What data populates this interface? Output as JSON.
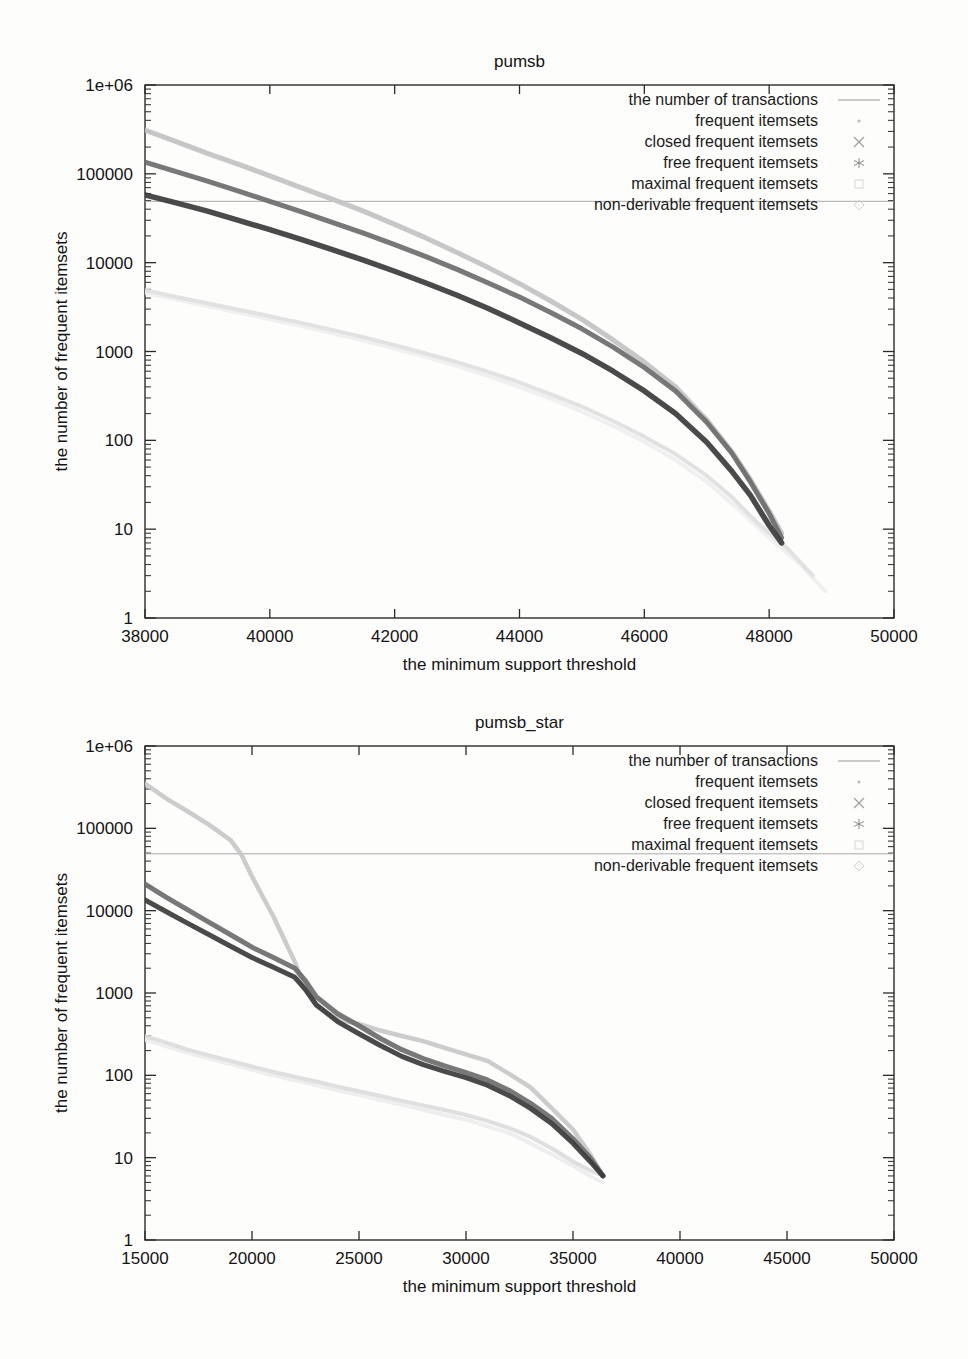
{
  "figure": {
    "background_color": "#fdfdfc",
    "axis_color": "#2b2b2b"
  },
  "shared": {
    "xlabel": "the minimum support threshold",
    "ylabel": "the number of frequent itemsets",
    "y_tick_labels": [
      "1",
      "10",
      "100",
      "1000",
      "10000",
      "100000",
      "1e+06"
    ],
    "ylim": [
      1,
      1000000
    ],
    "legend_entries": [
      {
        "label": "the number of transactions",
        "marker": "line",
        "color": "#9a9a9a"
      },
      {
        "label": "frequent itemsets",
        "marker": "dot",
        "color": "#bdbdbd"
      },
      {
        "label": "closed frequent itemsets",
        "marker": "cross",
        "color": "#9c9c9c"
      },
      {
        "label": "free frequent itemsets",
        "marker": "star",
        "color": "#8a8a8a"
      },
      {
        "label": "maximal frequent itemsets",
        "marker": "square",
        "color": "#d6d6d6"
      },
      {
        "label": "non-derivable frequent itemsets",
        "marker": "diamond",
        "color": "#cfcfcf"
      }
    ]
  },
  "chart_data": [
    {
      "id": "pumsb",
      "type": "line",
      "title": "pumsb",
      "xlabel": "the minimum support threshold",
      "ylabel": "the number of frequent itemsets",
      "xlim": [
        38000,
        50000
      ],
      "ylim": [
        1,
        1000000
      ],
      "yscale": "log",
      "x_tick_labels": [
        "38000",
        "40000",
        "42000",
        "44000",
        "46000",
        "48000",
        "50000"
      ],
      "x_ticks": [
        38000,
        40000,
        42000,
        44000,
        46000,
        48000,
        50000
      ],
      "y_tick_labels": [
        "1",
        "10",
        "100",
        "1000",
        "10000",
        "100000",
        "1e+06"
      ],
      "grid": false,
      "legend_position": "top-right",
      "series": [
        {
          "name": "the number of transactions",
          "color": "#a3a3a3",
          "width": 1.0,
          "x": [
            38000,
            50000
          ],
          "values": [
            49046,
            49046
          ]
        },
        {
          "name": "frequent itemsets",
          "color": "#c2c2c2",
          "width": 5.0,
          "x": [
            38000,
            38500,
            39000,
            39500,
            40000,
            40500,
            41000,
            41500,
            42000,
            42500,
            43000,
            43500,
            44000,
            44500,
            45000,
            45500,
            46000,
            46500,
            47000,
            47400,
            47700,
            48000,
            48200
          ],
          "values": [
            310000,
            230000,
            170000,
            128000,
            95000,
            70000,
            52000,
            38000,
            27000,
            19000,
            13000,
            8800,
            5800,
            3700,
            2300,
            1350,
            760,
            400,
            170,
            75,
            36,
            16,
            9
          ]
        },
        {
          "name": "closed frequent itemsets",
          "color": "#6d6d6d",
          "width": 5.0,
          "x": [
            38000,
            38500,
            39000,
            39500,
            40000,
            40500,
            41000,
            41500,
            42000,
            42500,
            43000,
            43500,
            44000,
            44500,
            45000,
            45500,
            46000,
            46500,
            47000,
            47400,
            47700,
            48000,
            48200
          ],
          "values": [
            135000,
            106000,
            83000,
            64000,
            49000,
            37500,
            28500,
            21500,
            16000,
            11700,
            8400,
            5900,
            4100,
            2750,
            1800,
            1120,
            660,
            360,
            160,
            72,
            34,
            15,
            8
          ]
        },
        {
          "name": "free frequent itemsets",
          "color": "#3b3b3b",
          "width": 5.5,
          "x": [
            38000,
            38500,
            39000,
            39500,
            40000,
            40500,
            41000,
            41500,
            42000,
            42500,
            43000,
            43500,
            44000,
            44500,
            45000,
            45500,
            46000,
            46500,
            47000,
            47400,
            47700,
            48000,
            48200
          ],
          "values": [
            58000,
            47000,
            38000,
            30000,
            23500,
            18300,
            14000,
            10700,
            8000,
            5900,
            4300,
            3050,
            2100,
            1430,
            950,
            600,
            360,
            200,
            95,
            45,
            24,
            11,
            7
          ]
        },
        {
          "name": "maximal frequent itemsets",
          "color": "#e0e0e0",
          "width": 4.0,
          "x": [
            38000,
            38500,
            39000,
            39500,
            40000,
            40500,
            41000,
            41500,
            42000,
            42500,
            43000,
            43500,
            44000,
            44500,
            45000,
            45500,
            46000,
            46500,
            47000,
            47400,
            47800,
            48300,
            48700
          ],
          "values": [
            4900,
            4100,
            3500,
            2950,
            2500,
            2100,
            1750,
            1450,
            1180,
            950,
            760,
            590,
            450,
            330,
            240,
            165,
            110,
            70,
            40,
            23,
            12,
            6,
            3
          ]
        },
        {
          "name": "non-derivable frequent itemsets",
          "color": "#efefef",
          "width": 4.0,
          "x": [
            38000,
            38500,
            39000,
            39500,
            40000,
            40500,
            41000,
            41500,
            42000,
            42500,
            43000,
            43500,
            44000,
            44500,
            45000,
            45500,
            46000,
            46500,
            47000,
            47500,
            48000,
            48500,
            48900
          ],
          "values": [
            4600,
            3850,
            3250,
            2750,
            2300,
            1930,
            1600,
            1330,
            1080,
            870,
            690,
            530,
            400,
            295,
            210,
            145,
            96,
            60,
            34,
            17,
            8,
            4,
            2
          ]
        }
      ]
    },
    {
      "id": "pumsb_star",
      "type": "line",
      "title": "pumsb_star",
      "xlabel": "the minimum support threshold",
      "ylabel": "the number of frequent itemsets",
      "xlim": [
        15000,
        50000
      ],
      "ylim": [
        1,
        1000000
      ],
      "yscale": "log",
      "x_tick_labels": [
        "15000",
        "20000",
        "25000",
        "30000",
        "35000",
        "40000",
        "45000",
        "50000"
      ],
      "x_ticks": [
        15000,
        20000,
        25000,
        30000,
        35000,
        40000,
        45000,
        50000
      ],
      "y_tick_labels": [
        "1",
        "10",
        "100",
        "1000",
        "10000",
        "100000",
        "1e+06"
      ],
      "grid": false,
      "legend_position": "top-right",
      "series": [
        {
          "name": "the number of transactions",
          "color": "#a3a3a3",
          "width": 1.0,
          "x": [
            15000,
            50000
          ],
          "values": [
            49046,
            49046
          ]
        },
        {
          "name": "frequent itemsets",
          "color": "#c8c8c8",
          "width": 4.5,
          "x": [
            15000,
            16000,
            17000,
            18000,
            19000,
            19500,
            20000,
            21000,
            22000,
            22500,
            23000,
            24000,
            25000,
            26000,
            27000,
            28000,
            29000,
            30000,
            31000,
            32000,
            33000,
            34000,
            35000,
            35800,
            36400
          ],
          "values": [
            350000,
            230000,
            160000,
            110000,
            72000,
            48000,
            26000,
            8500,
            2400,
            1100,
            700,
            480,
            420,
            350,
            300,
            260,
            215,
            180,
            150,
            105,
            72,
            40,
            22,
            11,
            6
          ]
        },
        {
          "name": "closed frequent itemsets",
          "color": "#6d6d6d",
          "width": 5.0,
          "x": [
            15000,
            16000,
            17000,
            18000,
            19000,
            20000,
            21000,
            22000,
            22500,
            23000,
            24000,
            25000,
            26000,
            27000,
            28000,
            29000,
            30000,
            31000,
            32000,
            33000,
            34000,
            35000,
            35800,
            36400
          ],
          "values": [
            21000,
            14500,
            10200,
            7200,
            5100,
            3600,
            2700,
            2000,
            1400,
            900,
            560,
            400,
            280,
            205,
            160,
            130,
            108,
            88,
            66,
            46,
            30,
            17,
            10,
            6
          ]
        },
        {
          "name": "free frequent itemsets",
          "color": "#3b3b3b",
          "width": 5.0,
          "x": [
            15000,
            16000,
            17000,
            18000,
            19000,
            20000,
            21000,
            22000,
            22500,
            23000,
            24000,
            25000,
            26000,
            27000,
            28000,
            29000,
            30000,
            31000,
            32000,
            33000,
            34000,
            35000,
            35800,
            36400
          ],
          "values": [
            13500,
            9700,
            7000,
            5100,
            3700,
            2700,
            2050,
            1550,
            1100,
            720,
            450,
            320,
            230,
            170,
            135,
            112,
            94,
            76,
            57,
            40,
            26,
            15,
            9,
            6
          ]
        },
        {
          "name": "maximal frequent itemsets",
          "color": "#dcdcdc",
          "width": 4.0,
          "x": [
            15000,
            16000,
            17000,
            18000,
            19000,
            20000,
            21000,
            22000,
            23000,
            24000,
            25000,
            26000,
            27000,
            28000,
            29000,
            30000,
            31000,
            32000,
            33000,
            34000,
            35000,
            35800,
            36400
          ],
          "values": [
            300,
            250,
            205,
            175,
            150,
            128,
            110,
            96,
            84,
            73,
            64,
            56,
            49,
            43,
            38,
            33,
            28,
            23,
            18,
            13,
            9,
            7,
            6
          ]
        },
        {
          "name": "non-derivable frequent itemsets",
          "color": "#ededed",
          "width": 4.0,
          "x": [
            15000,
            16000,
            17000,
            18000,
            19000,
            20000,
            21000,
            22000,
            23000,
            24000,
            25000,
            26000,
            27000,
            28000,
            29000,
            30000,
            31000,
            32000,
            33000,
            34000,
            35000,
            35800,
            36400
          ],
          "values": [
            270,
            225,
            188,
            160,
            137,
            117,
            100,
            87,
            76,
            66,
            58,
            50,
            44,
            38,
            33,
            29,
            24,
            20,
            15,
            11,
            8,
            6,
            5
          ]
        }
      ]
    }
  ]
}
